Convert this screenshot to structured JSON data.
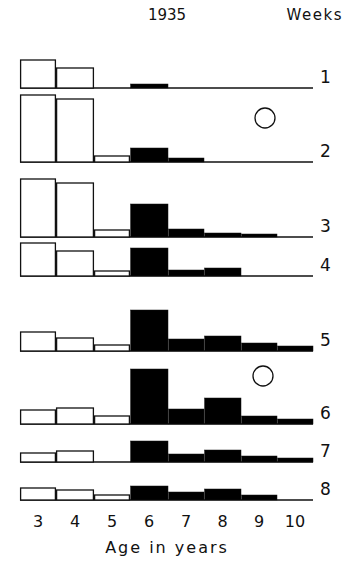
{
  "chart_data": {
    "type": "bar",
    "title": "1935",
    "series_label": "Weeks",
    "xlabel": "Age in years",
    "ylabel": "",
    "categories": [
      "3",
      "4",
      "5",
      "6",
      "7",
      "8",
      "9",
      "10"
    ],
    "open_bar_ages": [
      "3",
      "4",
      "5"
    ],
    "filled_bar_ages": [
      "6",
      "7",
      "8",
      "9",
      "10"
    ],
    "units": "relative bar height (px)",
    "panels": [
      {
        "week": "1",
        "values": [
          28,
          20,
          0,
          4,
          0,
          0,
          0,
          0
        ],
        "marker": false
      },
      {
        "week": "2",
        "values": [
          67,
          63,
          6,
          14,
          4,
          0,
          0,
          0
        ],
        "marker": true
      },
      {
        "week": "3",
        "values": [
          58,
          54,
          7,
          33,
          8,
          4,
          3,
          0
        ],
        "marker": false
      },
      {
        "week": "4",
        "values": [
          33,
          25,
          5,
          28,
          6,
          8,
          0,
          0
        ],
        "marker": false
      },
      {
        "week": "5",
        "values": [
          19,
          13,
          6,
          41,
          12,
          15,
          8,
          5
        ],
        "marker": false
      },
      {
        "week": "6",
        "values": [
          14,
          16,
          8,
          55,
          15,
          26,
          8,
          5
        ],
        "marker": true
      },
      {
        "week": "7",
        "values": [
          9,
          11,
          0,
          21,
          8,
          12,
          6,
          4
        ],
        "marker": false
      },
      {
        "week": "8",
        "values": [
          12,
          10,
          5,
          14,
          8,
          11,
          5,
          0
        ],
        "marker": false
      }
    ],
    "grid": false,
    "legend": "none"
  },
  "layout": {
    "baselines": [
      88,
      162,
      237,
      276,
      351,
      424,
      462,
      500
    ],
    "bar_edges": [
      20,
      56,
      94,
      130,
      168,
      204,
      241,
      277,
      313
    ],
    "markers": [
      {
        "panel": 1,
        "cx": 265,
        "cy": 118,
        "r": 10
      },
      {
        "panel": 5,
        "cx": 263,
        "cy": 376,
        "r": 10
      }
    ]
  },
  "colors": {
    "open_fill": "#ffffff",
    "filled": "#000000",
    "stroke": "#111111"
  }
}
